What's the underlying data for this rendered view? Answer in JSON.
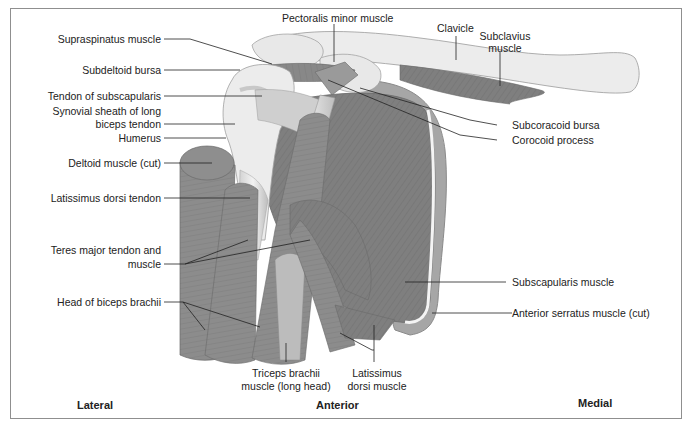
{
  "figure": {
    "colors": {
      "muscle": "#8a8a8a",
      "muscle_dark": "#7a7a7a",
      "bone": "#e6e6e6",
      "tendon": "#d8d8d8",
      "border": "#8f8f8f",
      "text": "#222222"
    }
  },
  "labels": {
    "left": [
      {
        "text": "Supraspinatus muscle"
      },
      {
        "text": "Subdeltoid bursa"
      },
      {
        "text": "Tendon of subscapularis"
      },
      {
        "text": "Synovial sheath of long"
      },
      {
        "text": "biceps tendon"
      },
      {
        "text": "Humerus"
      },
      {
        "text": "Deltoid muscle (cut)"
      },
      {
        "text": "Latissimus dorsi tendon"
      },
      {
        "text": "Teres major tendon and"
      },
      {
        "text": "muscle"
      },
      {
        "text": "Head of biceps brachii"
      }
    ],
    "top": [
      {
        "text": "Pectoralis minor muscle"
      },
      {
        "text": "Clavicle"
      },
      {
        "text": "Subclavius"
      },
      {
        "text": "muscle"
      }
    ],
    "right": [
      {
        "text": "Subcoracoid bursa"
      },
      {
        "text": "Corocoid process"
      },
      {
        "text": "Subscapularis muscle"
      },
      {
        "text": "Anterior serratus muscle (cut)"
      }
    ],
    "bottom": [
      {
        "text": "Triceps brachii"
      },
      {
        "text": "muscle (long head)"
      },
      {
        "text": "Latissimus"
      },
      {
        "text": "dorsi muscle"
      }
    ]
  },
  "orientation": {
    "lateral": "Lateral",
    "anterior": "Anterior",
    "medial": "Medial"
  }
}
